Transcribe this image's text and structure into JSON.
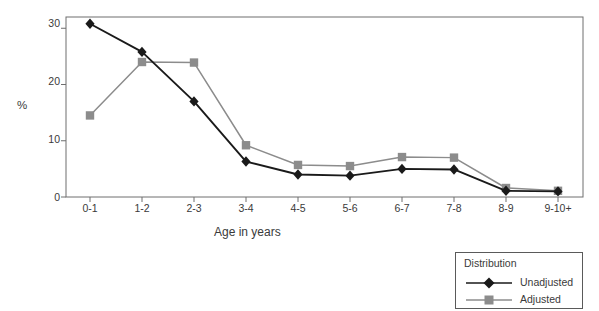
{
  "chart_data": {
    "type": "line",
    "title": "",
    "xlabel": "Age in years",
    "ylabel": "%",
    "categories": [
      "0-1",
      "1-2",
      "2-3",
      "3-4",
      "4-5",
      "5-6",
      "6-7",
      "7-8",
      "8-9",
      "9-10+"
    ],
    "series": [
      {
        "name": "Unadjusted",
        "color": "#1a1a1a",
        "marker": "diamond",
        "values": [
          30.8,
          25.8,
          17.0,
          6.3,
          4.0,
          3.8,
          5.0,
          4.9,
          1.1,
          1.0
        ]
      },
      {
        "name": "Adjusted",
        "color": "#8c8c8c",
        "marker": "square",
        "values": [
          14.5,
          24.0,
          23.9,
          9.2,
          5.7,
          5.5,
          7.1,
          7.0,
          1.6,
          1.1
        ]
      }
    ],
    "ylim": [
      0,
      32
    ],
    "yticks": [
      0,
      10,
      20,
      30
    ],
    "ytick_labels": [
      "0",
      "10",
      "20",
      "30"
    ],
    "grid": false,
    "legend_position": "bottom-right",
    "legend_title": "Distribution"
  },
  "legend": {
    "title": "Distribution",
    "entries": [
      {
        "label": "Unadjusted"
      },
      {
        "label": "Adjusted"
      }
    ]
  },
  "axes": {
    "y_title": "%",
    "x_title": "Age in years",
    "y_tick_0": "0",
    "y_tick_10": "10",
    "y_tick_20": "20",
    "y_tick_30": "30",
    "x_tick_0": "0-1",
    "x_tick_1": "1-2",
    "x_tick_2": "2-3",
    "x_tick_3": "3-4",
    "x_tick_4": "4-5",
    "x_tick_5": "5-6",
    "x_tick_6": "6-7",
    "x_tick_7": "7-8",
    "x_tick_8": "8-9",
    "x_tick_9": "9-10+"
  }
}
